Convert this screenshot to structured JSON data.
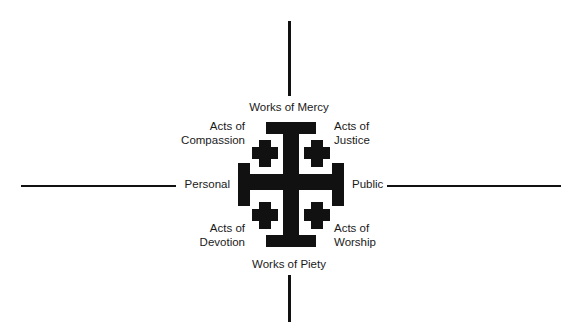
{
  "figure": {
    "name": "Jerusalem Cross diagram of Wesleyan works",
    "background_color": "#ffffff",
    "ink_color": "#111111"
  },
  "axes": {
    "vertical_top_label": "Works of Mercy",
    "vertical_bottom_label": "Works of Piety",
    "horizontal_left_label": "Personal",
    "horizontal_right_label": "Public"
  },
  "quadrant_labels": {
    "top_left": "Acts of\nCompassion",
    "top_right": "Acts of\nJustice",
    "bottom_left": "Acts of\nDevotion",
    "bottom_right": "Acts of\nWorship"
  },
  "cross": {
    "type": "jerusalem-cross",
    "description": "Large central potent (crutch) cross with four small Greek crosses in the quadrants",
    "color": "#111111"
  }
}
